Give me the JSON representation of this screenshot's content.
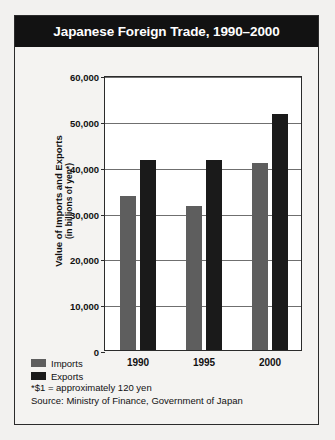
{
  "card": {
    "title": "Japanese Foreign Trade, 1990–2000"
  },
  "legend": {
    "items": [
      {
        "label": "Imports",
        "color": "#5e5e5e",
        "swatch": "legend-swatch-imports"
      },
      {
        "label": "Exports",
        "color": "#1a1a1a",
        "swatch": "legend-swatch-exports"
      }
    ]
  },
  "notes": {
    "footnote": "*$1 = approximately 120 yen",
    "source": "Source: Ministry of Finance, Government of Japan"
  },
  "axis": {
    "y_title_main": "Value of Imports and Exports",
    "y_title_sub": "(in billions of yen*)"
  },
  "chart_data": {
    "type": "bar",
    "title": "Japanese Foreign Trade, 1990–2000",
    "xlabel": "",
    "ylabel": "Value of Imports and Exports (in billions of yen*)",
    "categories": [
      "1990",
      "1995",
      "2000"
    ],
    "series": [
      {
        "name": "Imports",
        "color": "#5e5e5e",
        "values": [
          33500,
          31400,
          40900
        ]
      },
      {
        "name": "Exports",
        "color": "#1a1a1a",
        "values": [
          41500,
          41500,
          51500
        ]
      }
    ],
    "ylim": [
      0,
      60000
    ],
    "yticks": [
      0,
      10000,
      20000,
      30000,
      40000,
      50000,
      60000
    ],
    "ytick_labels": [
      "0",
      "10,000",
      "20,000",
      "30,000",
      "40,000",
      "50,000",
      "60,000"
    ],
    "grid": true,
    "legend_position": "below-left",
    "annotations": [
      "*$1 = approximately 120 yen",
      "Source: Ministry of Finance, Government of Japan"
    ]
  }
}
